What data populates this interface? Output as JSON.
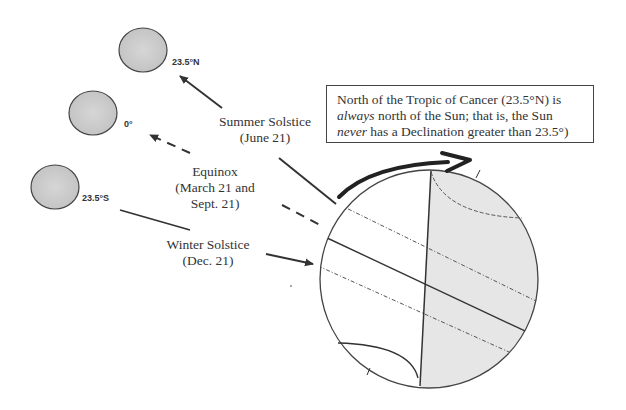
{
  "suns": [
    {
      "name": "summer",
      "declination_label": "23.5°N"
    },
    {
      "name": "equinox",
      "declination_label": "0°"
    },
    {
      "name": "winter",
      "declination_label": "23.5°S"
    }
  ],
  "labels": {
    "summer_line1": "Summer Solstice",
    "summer_line2": "(June 21)",
    "equinox_line1": "Equinox",
    "equinox_line2": "(March 21 and",
    "equinox_line3": "Sept. 21)",
    "winter_line1": "Winter Solstice",
    "winter_line2": "(Dec. 21)"
  },
  "note": {
    "line1": "North of the Tropic of Cancer (23.5°N) is",
    "line2_italic": "always",
    "line2_rest": " north of the Sun; that is, the Sun",
    "line3_italic": "never",
    "line3_rest": " has a Declination greater than 23.5°)"
  },
  "colors": {
    "sun_fill": "#cfcfcf",
    "night_fill": "#e6e6e6",
    "line": "#333333"
  }
}
